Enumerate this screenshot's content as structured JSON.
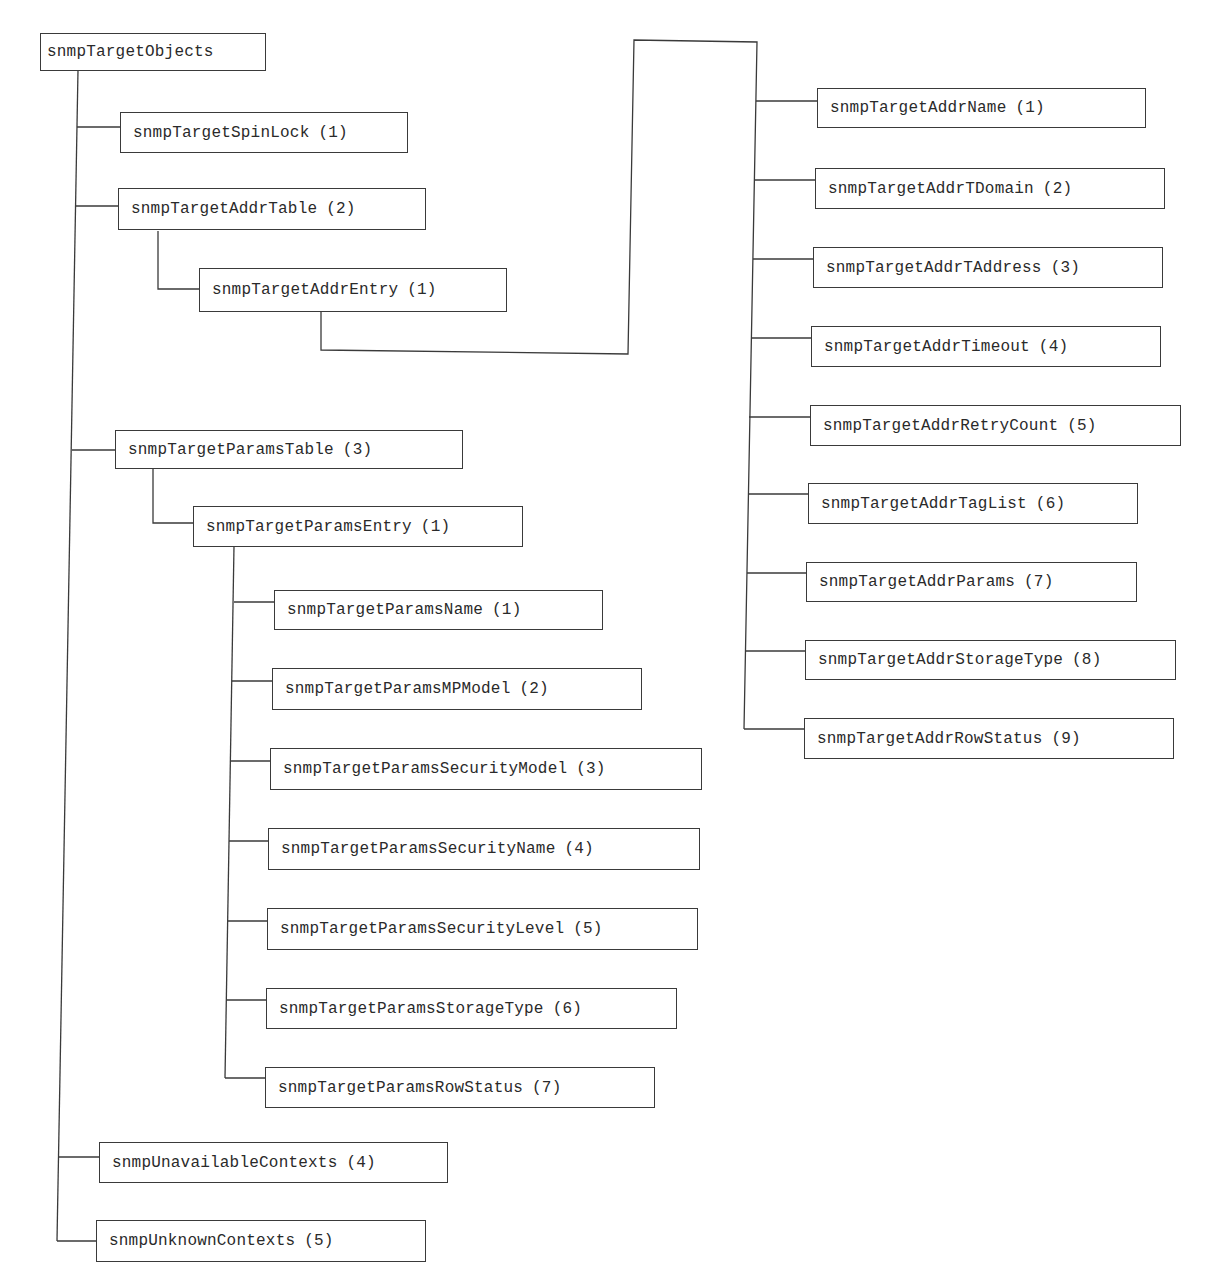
{
  "diagram": {
    "root": {
      "label": "snmpTargetObjects"
    },
    "spin_lock": {
      "label": "snmpTargetSpinLock",
      "index": "(1)"
    },
    "addr_table": {
      "label": "snmpTargetAddrTable",
      "index": "(2)"
    },
    "addr_entry": {
      "label": "snmpTargetAddrEntry",
      "index": "(1)"
    },
    "addr_columns": [
      {
        "label": "snmpTargetAddrName",
        "index": "(1)"
      },
      {
        "label": "snmpTargetAddrTDomain",
        "index": "(2)"
      },
      {
        "label": "snmpTargetAddrTAddress",
        "index": "(3)"
      },
      {
        "label": "snmpTargetAddrTimeout",
        "index": "(4)"
      },
      {
        "label": "snmpTargetAddrRetryCount",
        "index": "(5)"
      },
      {
        "label": "snmpTargetAddrTagList",
        "index": "(6)"
      },
      {
        "label": "snmpTargetAddrParams",
        "index": "(7)"
      },
      {
        "label": "snmpTargetAddrStorageType",
        "index": "(8)"
      },
      {
        "label": "snmpTargetAddrRowStatus",
        "index": "(9)"
      }
    ],
    "params_table": {
      "label": "snmpTargetParamsTable",
      "index": "(3)"
    },
    "params_entry": {
      "label": "snmpTargetParamsEntry",
      "index": "(1)"
    },
    "params_columns": [
      {
        "label": "snmpTargetParamsName",
        "index": "(1)"
      },
      {
        "label": "snmpTargetParamsMPModel",
        "index": "(2)"
      },
      {
        "label": "snmpTargetParamsSecurityModel",
        "index": "(3)"
      },
      {
        "label": "snmpTargetParamsSecurityName",
        "index": "(4)"
      },
      {
        "label": "snmpTargetParamsSecurityLevel",
        "index": "(5)"
      },
      {
        "label": "snmpTargetParamsStorageType",
        "index": "(6)"
      },
      {
        "label": "snmpTargetParamsRowStatus",
        "index": "(7)"
      }
    ],
    "unavailable_contexts": {
      "label": "snmpUnavailableContexts",
      "index": "(4)"
    },
    "unknown_contexts": {
      "label": "snmpUnknownContexts",
      "index": "(5)"
    },
    "colors": {
      "line": "#3a3a3a",
      "text": "#2a2a2a",
      "background": "#ffffff"
    }
  }
}
